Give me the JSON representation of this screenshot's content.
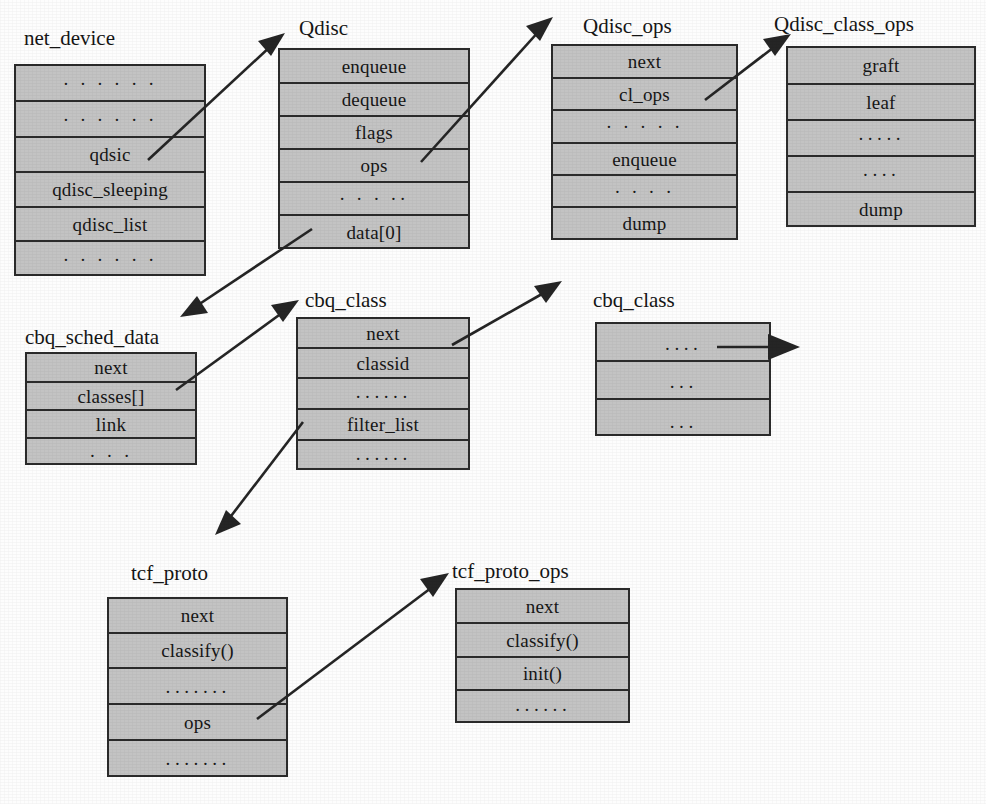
{
  "figure": {
    "kind": "struct-relationship-diagram",
    "box_fill_color": "#c3c3c3",
    "box_border_color": "#2b2b2b",
    "arrow_color": "#252525",
    "background_color": "#fdfdfd"
  },
  "structs": {
    "net_device": {
      "title": "net_device",
      "fields": [
        "· · · · · ·",
        "· · · · · ·",
        "qdsic",
        "qdisc_sleeping",
        "qdisc_list",
        "· · · · · ·"
      ]
    },
    "qdisc": {
      "title": "Qdisc",
      "fields": [
        "enqueue",
        "dequeue",
        "flags",
        "ops",
        "· · · ··",
        "data[0]"
      ]
    },
    "qdisc_ops": {
      "title": "Qdisc_ops",
      "fields": [
        "next",
        "cl_ops",
        "· · · · ·",
        "enqueue",
        "· · · ·",
        "dump"
      ]
    },
    "qdisc_class_ops": {
      "title": "Qdisc_class_ops",
      "fields": [
        "graft",
        "leaf",
        "·····",
        "····",
        "dump"
      ]
    },
    "cbq_sched_data": {
      "title": "cbq_sched_data",
      "fields": [
        "next",
        "classes[]",
        "link",
        "· · ·"
      ]
    },
    "cbq_class_left": {
      "title": "cbq_class",
      "fields": [
        "next",
        "classid",
        "······",
        "filter_list",
        "······"
      ]
    },
    "cbq_class_right": {
      "title": "cbq_class",
      "fields": [
        "····",
        "···",
        "···"
      ]
    },
    "tcf_proto": {
      "title": "tcf_proto",
      "fields": [
        "next",
        "classify()",
        "·······",
        "ops",
        "·······"
      ]
    },
    "tcf_proto_ops": {
      "title": "tcf_proto_ops",
      "fields": [
        "next",
        "classify()",
        "init()",
        "······"
      ]
    }
  },
  "arrows": [
    {
      "name": "net-device-qdsic-to-qdisc",
      "from": "net_device.qdsic",
      "to": "Qdisc"
    },
    {
      "name": "qdisc-ops-to-qdisc-ops",
      "from": "Qdisc.ops",
      "to": "Qdisc_ops"
    },
    {
      "name": "qdisc-ops-cl-ops-to-qdisc-class-ops",
      "from": "Qdisc_ops.cl_ops",
      "to": "Qdisc_class_ops"
    },
    {
      "name": "qdisc-data-to-cbq-sched-data",
      "from": "Qdisc.data[0]",
      "to": "cbq_sched_data"
    },
    {
      "name": "cbq-sched-classes-to-cbq-class",
      "from": "cbq_sched_data.classes[]",
      "to": "cbq_class"
    },
    {
      "name": "cbq-class-next-to-cbq-class",
      "from": "cbq_class.next",
      "to": "cbq_class"
    },
    {
      "name": "cbq-class-right-chain",
      "from": "cbq_class",
      "to": "next cbq_class"
    },
    {
      "name": "cbq-class-filter-list-to-tcf-proto",
      "from": "cbq_class.filter_list",
      "to": "tcf_proto"
    },
    {
      "name": "tcf-proto-ops-to-tcf-proto-ops",
      "from": "tcf_proto.ops",
      "to": "tcf_proto_ops"
    }
  ]
}
